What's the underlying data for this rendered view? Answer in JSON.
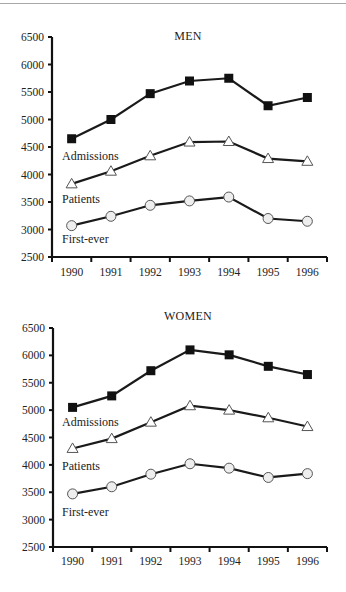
{
  "chart_data": [
    {
      "type": "line",
      "title": "MEN",
      "xlabel": "",
      "ylabel": "",
      "categories": [
        "1990",
        "1991",
        "1992",
        "1993",
        "1994",
        "1995",
        "1996"
      ],
      "yticks": [
        2500,
        3000,
        3500,
        4000,
        4500,
        5000,
        5500,
        6000,
        6500
      ],
      "ylim": [
        2500,
        6500
      ],
      "grid": false,
      "legend": "inline labels",
      "series": [
        {
          "name": "Admissions",
          "marker": "filled-square",
          "values": [
            4650,
            5000,
            5470,
            5700,
            5750,
            5250,
            5400
          ]
        },
        {
          "name": "Patients",
          "marker": "hollow-triangle",
          "values": [
            3830,
            4060,
            4340,
            4590,
            4600,
            4290,
            4240
          ]
        },
        {
          "name": "First-ever",
          "marker": "hollow-circle",
          "values": [
            3070,
            3240,
            3440,
            3520,
            3590,
            3200,
            3150
          ]
        }
      ]
    },
    {
      "type": "line",
      "title": "WOMEN",
      "xlabel": "",
      "ylabel": "",
      "categories": [
        "1990",
        "1991",
        "1992",
        "1993",
        "1994",
        "1995",
        "1996"
      ],
      "yticks": [
        2500,
        3000,
        3500,
        4000,
        4500,
        5000,
        5500,
        6000,
        6500
      ],
      "ylim": [
        2500,
        6500
      ],
      "grid": false,
      "legend": "inline labels",
      "series": [
        {
          "name": "Admissions",
          "marker": "filled-square",
          "values": [
            5050,
            5260,
            5720,
            6100,
            6010,
            5800,
            5650
          ]
        },
        {
          "name": "Patients",
          "marker": "hollow-triangle",
          "values": [
            4300,
            4480,
            4780,
            5080,
            5000,
            4860,
            4700
          ]
        },
        {
          "name": "First-ever",
          "marker": "hollow-circle",
          "values": [
            3470,
            3600,
            3830,
            4020,
            3940,
            3770,
            3840
          ]
        }
      ]
    }
  ],
  "panels": [
    {
      "title": "MEN",
      "labels": {
        "admissions": "Admissions",
        "patients": "Patients",
        "first_ever": "First-ever"
      }
    },
    {
      "title": "WOMEN",
      "labels": {
        "admissions": "Admissions",
        "patients": "Patients",
        "first_ever": "First-ever"
      }
    }
  ],
  "colors": {
    "line": "#1a1a1a",
    "square_fill": "#111111",
    "triangle_fill": "#ffffff",
    "circle_fill": "#eeeeee",
    "axis": "#111111",
    "top_rule": "#a8a8a8"
  }
}
